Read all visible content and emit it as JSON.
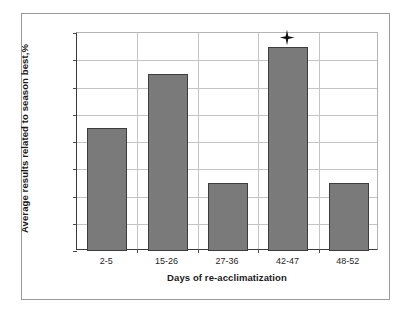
{
  "chart_data": {
    "type": "bar",
    "title": "",
    "subtitle": "",
    "categories": [
      "2-5",
      "15-26",
      "27-36",
      "42-47",
      "48-52"
    ],
    "values": [
      99.1,
      99.5,
      98.7,
      99.7,
      98.7
    ],
    "xlabel": "Days of re-acclimatization",
    "ylabel": "Average results related to season best,%",
    "ylim": [
      98.2,
      99.8
    ],
    "ytick_labels": [
      "98.2",
      "98.4",
      "98.6",
      "98.8",
      "99",
      "99.2",
      "99.4",
      "99.6",
      "99.8"
    ],
    "ytick_values": [
      98.2,
      98.4,
      98.6,
      98.8,
      99,
      99.2,
      99.4,
      99.6,
      99.8
    ],
    "ytick_step": 0.2,
    "grid": "both",
    "legend": "none",
    "bar_color": "#7a7a7a",
    "bar_border_color": "#3d3d3d",
    "gridline_color": "#c4c4c4",
    "axis_color": "#3a3a3a",
    "annotations": [
      {
        "marker": "star-icon",
        "category": "42-47",
        "value": 99.7,
        "meaning": "significance marker"
      }
    ]
  }
}
